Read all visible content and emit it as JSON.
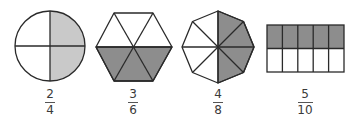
{
  "colors": {
    "light_shade": "#c9c9c9",
    "dark_shade": "#8d8d8d",
    "stroke": "#2a2a2a",
    "background": "#ffffff"
  },
  "figures": [
    {
      "shape": "circle",
      "parts": 4,
      "shaded": 2,
      "fraction": {
        "numerator": "2",
        "denominator": "4"
      }
    },
    {
      "shape": "hexagon",
      "parts": 6,
      "shaded": 3,
      "fraction": {
        "numerator": "3",
        "denominator": "6"
      }
    },
    {
      "shape": "octagon",
      "parts": 8,
      "shaded": 4,
      "fraction": {
        "numerator": "4",
        "denominator": "8"
      }
    },
    {
      "shape": "rectangle",
      "parts": 10,
      "shaded": 5,
      "fraction": {
        "numerator": "5",
        "denominator": "10"
      }
    }
  ]
}
